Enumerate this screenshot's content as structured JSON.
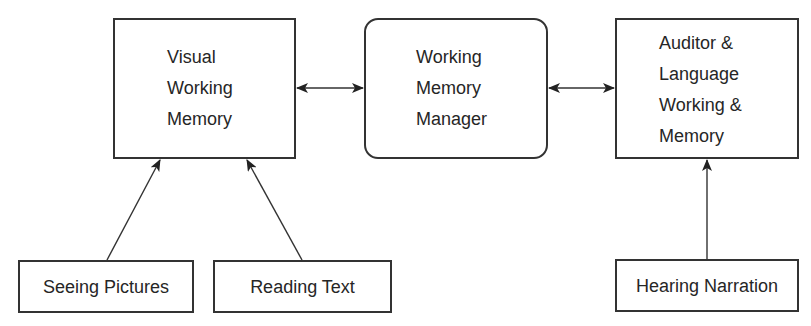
{
  "diagram": {
    "nodes": {
      "visual_wm": {
        "lines": [
          "Visual",
          "Working",
          "Memory"
        ]
      },
      "wm_manager": {
        "lines": [
          "Working",
          "Memory",
          "Manager"
        ]
      },
      "auditory_wm": {
        "lines": [
          "Auditor &",
          "Language",
          "Working &",
          "Memory"
        ]
      },
      "seeing_pictures": {
        "label": "Seeing Pictures"
      },
      "reading_text": {
        "label": "Reading Text"
      },
      "hearing_narration": {
        "label": "Hearing Narration"
      }
    },
    "edges": [
      {
        "from": "visual_wm",
        "to": "wm_manager",
        "type": "bidirectional"
      },
      {
        "from": "wm_manager",
        "to": "auditory_wm",
        "type": "bidirectional"
      },
      {
        "from": "seeing_pictures",
        "to": "visual_wm",
        "type": "directed"
      },
      {
        "from": "reading_text",
        "to": "visual_wm",
        "type": "directed"
      },
      {
        "from": "hearing_narration",
        "to": "auditory_wm",
        "type": "directed"
      }
    ],
    "colors": {
      "stroke": "#333333",
      "text": "#262626",
      "background": "#ffffff"
    }
  }
}
